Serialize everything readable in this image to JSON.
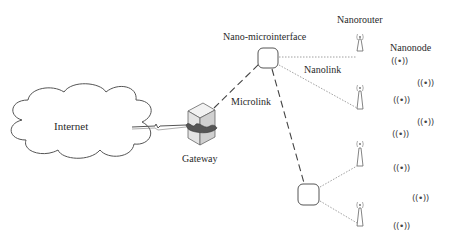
{
  "diagram": {
    "labels": {
      "internet": "Internet",
      "gateway": "Gateway",
      "nano_microinterface": "Nano-microinterface",
      "nanorouter": "Nanorouter",
      "nanonode": "Nanonode",
      "nanolink": "Nanolink",
      "microlink": "Microlink"
    },
    "nanonode_symbol": "((•))",
    "nodes": [
      {
        "id": "internet",
        "type": "cloud"
      },
      {
        "id": "gateway",
        "type": "server"
      },
      {
        "id": "interface-1",
        "type": "nano-microinterface"
      },
      {
        "id": "interface-2",
        "type": "nano-microinterface"
      },
      {
        "id": "router-1",
        "type": "nanorouter"
      },
      {
        "id": "router-2",
        "type": "nanorouter"
      },
      {
        "id": "router-3",
        "type": "nanorouter"
      },
      {
        "id": "router-4",
        "type": "nanorouter"
      }
    ],
    "edges": [
      {
        "from": "internet",
        "to": "gateway",
        "style": "lightning-link"
      },
      {
        "from": "gateway",
        "to": "interface-1",
        "style": "dashed",
        "label": "Microlink"
      },
      {
        "from": "interface-1",
        "to": "interface-2",
        "style": "dashed"
      },
      {
        "from": "interface-1",
        "to": "router-1",
        "style": "dotted",
        "label": "Nanolink"
      },
      {
        "from": "interface-1",
        "to": "router-2",
        "style": "dotted"
      },
      {
        "from": "interface-2",
        "to": "router-3",
        "style": "dotted"
      },
      {
        "from": "interface-2",
        "to": "router-4",
        "style": "dotted"
      }
    ],
    "nanonode_count": 9
  }
}
